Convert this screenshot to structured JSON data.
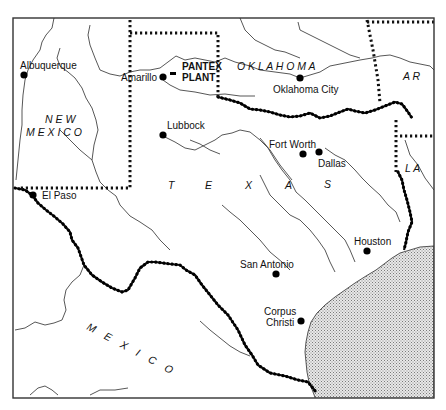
{
  "map": {
    "title": "Texas and surrounding region — Pantex Plant location",
    "frame": {
      "x": 13,
      "y": 18,
      "width": 421,
      "height": 380
    },
    "colors": {
      "background": "#ffffff",
      "ink": "#111111",
      "gulf_stipple": "#9a9a9a"
    },
    "regions": {
      "new_mexico": {
        "line1": "N  E  W",
        "line2": "M  E  X  I  C  O"
      },
      "oklahoma": "O  K  L  A  H  O  M  A",
      "texas": [
        "T",
        "E",
        "X",
        "A",
        "S"
      ],
      "mexico": "M E X I C O",
      "arkansas": "A  R",
      "louisiana": "L  A"
    },
    "facility": {
      "line1": "PANTEX",
      "line2": "PLANT",
      "marker": "facility-marker"
    },
    "cities": [
      {
        "name": "Albuquerque",
        "x": 24,
        "y": 75
      },
      {
        "name": "Amarillo",
        "x": 163,
        "y": 77
      },
      {
        "name": "Oklahoma City",
        "x": 300,
        "y": 78
      },
      {
        "name": "Lubbock",
        "x": 163,
        "y": 135
      },
      {
        "name": "Fort Worth",
        "x": 303,
        "y": 154
      },
      {
        "name": "Dallas",
        "x": 319,
        "y": 152
      },
      {
        "name": "El Paso",
        "x": 33,
        "y": 195
      },
      {
        "name": "Houston",
        "x": 367,
        "y": 251
      },
      {
        "name": "San Antonio",
        "x": 276,
        "y": 274
      },
      {
        "name": "Corpus",
        "line2": "Christi",
        "x": 301,
        "y": 321
      }
    ]
  }
}
